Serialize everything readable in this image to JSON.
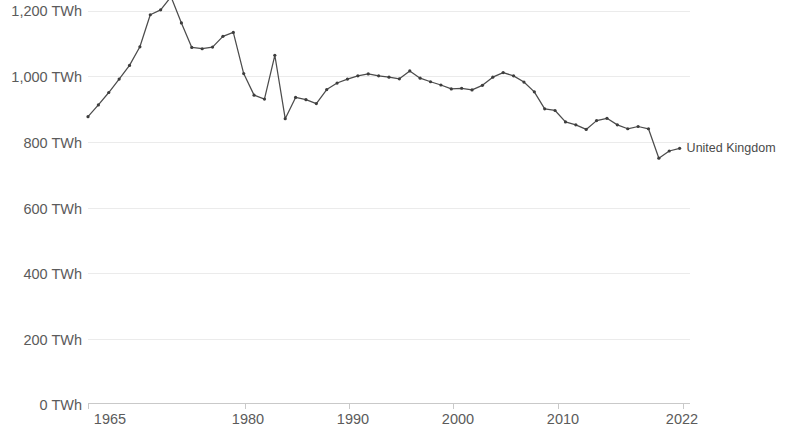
{
  "chart_data": {
    "type": "line",
    "title": "",
    "subtitle": "",
    "xlabel": "",
    "ylabel": "",
    "unit": "TWh",
    "grid": true,
    "legend_position": "end-of-line",
    "xlim": [
      1965,
      2023
    ],
    "ylim": [
      0,
      1260
    ],
    "y_ticks": [
      0,
      200,
      400,
      600,
      800,
      1000,
      1200
    ],
    "y_tick_labels": [
      "0 TWh",
      "200 TWh",
      "400 TWh",
      "600 TWh",
      "800 TWh",
      "1,000 TWh",
      "1,200 TWh"
    ],
    "x_ticks": [
      1965,
      1980,
      1990,
      2000,
      2010,
      2022
    ],
    "x_tick_labels": [
      "1965",
      "1980",
      "1990",
      "2000",
      "2010",
      "2022"
    ],
    "series": [
      {
        "name": "United Kingdom",
        "color": "#4c4c4c",
        "label_text": "United Kingdom",
        "x": [
          1965,
          1966,
          1967,
          1968,
          1969,
          1970,
          1971,
          1972,
          1973,
          1974,
          1975,
          1976,
          1977,
          1978,
          1979,
          1980,
          1981,
          1982,
          1983,
          1984,
          1985,
          1986,
          1987,
          1988,
          1989,
          1990,
          1991,
          1992,
          1993,
          1994,
          1995,
          1996,
          1997,
          1998,
          1999,
          2000,
          2001,
          2002,
          2003,
          2004,
          2005,
          2006,
          2007,
          2008,
          2009,
          2010,
          2011,
          2012,
          2013,
          2014,
          2015,
          2016,
          2017,
          2018,
          2019,
          2020,
          2021,
          2022
        ],
        "values": [
          878,
          914,
          952,
          993,
          1035,
          1092,
          1190,
          1205,
          1245,
          1165,
          1090,
          1086,
          1091,
          1124,
          1136,
          1010,
          944,
          932,
          1066,
          872,
          937,
          930,
          918,
          961,
          981,
          993,
          1003,
          1009,
          1003,
          999,
          994,
          1018,
          996,
          985,
          975,
          963,
          965,
          960,
          974,
          999,
          1013,
          1003,
          984,
          954,
          902,
          897,
          862,
          853,
          839,
          866,
          873,
          853,
          841,
          848,
          841,
          751,
          773,
          781
        ]
      }
    ]
  },
  "axis": {
    "y_labels": [
      "1,200 TWh",
      "1,000 TWh",
      "800 TWh",
      "600 TWh",
      "400 TWh",
      "200 TWh",
      "0 TWh"
    ],
    "x_labels": [
      "1965",
      "1980",
      "1990",
      "2000",
      "2010",
      "2022"
    ]
  },
  "annotations": {
    "series_end_label": "United Kingdom"
  }
}
